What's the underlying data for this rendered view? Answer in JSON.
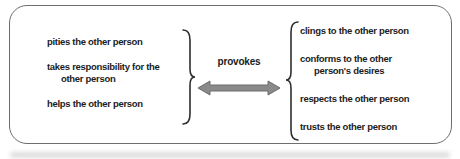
{
  "diagram": {
    "left_items": [
      {
        "lines": [
          "pities the other person"
        ]
      },
      {
        "lines": [
          "takes responsibility for the",
          "other person"
        ]
      },
      {
        "lines": [
          "helps the other person"
        ]
      }
    ],
    "right_items": [
      {
        "lines": [
          "clings to the other person"
        ]
      },
      {
        "lines": [
          "conforms to the other",
          "person's desires"
        ]
      },
      {
        "lines": [
          "respects the other person"
        ]
      },
      {
        "lines": [
          "trusts the other person"
        ]
      }
    ],
    "arrow_label": "provokes",
    "colors": {
      "text": "#1c1c1c",
      "arrow_fill": "#8a8a8a",
      "arrow_outline": "#6c6c6c",
      "frame_border": "#6e6e6e",
      "brace": "#2f2f2f"
    }
  }
}
